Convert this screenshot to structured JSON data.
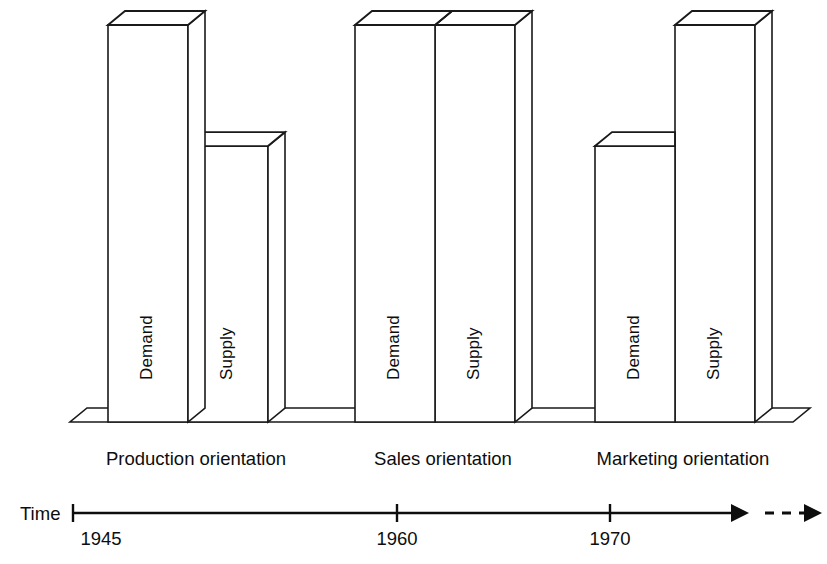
{
  "chart_data": {
    "type": "bar",
    "title": "",
    "subtitle": "",
    "xlabel": "Time",
    "ylabel": "",
    "style": "3d-isometric-bars",
    "grid": false,
    "legend": false,
    "categories": [
      "Production orientation",
      "Sales orientation",
      "Marketing orientation"
    ],
    "series": [
      {
        "name": "Demand",
        "values": [
          100,
          100,
          70
        ]
      },
      {
        "name": "Supply",
        "values": [
          70,
          100,
          100
        ]
      }
    ],
    "ylim": [
      0,
      100
    ],
    "annotations": [
      "Demand exceeds supply in the production orientation era",
      "Demand equals supply in the sales orientation era",
      "Supply exceeds demand in the marketing orientation era"
    ],
    "time_axis": {
      "label": "Time",
      "ticks": [
        "1945",
        "1960",
        "1970"
      ],
      "tick_positions": [
        0,
        50,
        75
      ],
      "arrow": true,
      "dashed_continuation": true
    }
  },
  "bars": [
    {
      "group": 0,
      "series": "Demand",
      "label": "Demand",
      "height_frac": 1.0
    },
    {
      "group": 0,
      "series": "Supply",
      "label": "Supply",
      "height_frac": 0.695
    },
    {
      "group": 1,
      "series": "Demand",
      "label": "Demand",
      "height_frac": 1.0
    },
    {
      "group": 1,
      "series": "Supply",
      "label": "Supply",
      "height_frac": 1.0
    },
    {
      "group": 2,
      "series": "Demand",
      "label": "Demand",
      "height_frac": 0.695
    },
    {
      "group": 2,
      "series": "Supply",
      "label": "Supply",
      "height_frac": 1.0
    }
  ],
  "group_labels": [
    "Production orientation",
    "Sales orientation",
    "Marketing orientation"
  ],
  "axis": {
    "label": "Time",
    "ticks": [
      {
        "text": "1945"
      },
      {
        "text": "1960"
      },
      {
        "text": "1970"
      }
    ]
  },
  "colors": {
    "stroke": "#1a1a1a",
    "fill": "#ffffff",
    "text": "#0d0d0d",
    "background": "#ffffff"
  }
}
